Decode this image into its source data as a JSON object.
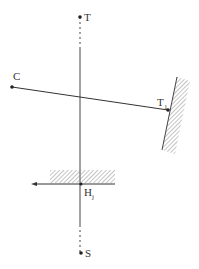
{
  "diagram": {
    "points": {
      "T": {
        "label": "T",
        "x": 80,
        "y": 17
      },
      "C": {
        "label": "C",
        "x": 12,
        "y": 87
      },
      "T1": {
        "label": "T",
        "subscript": "1",
        "x": 168,
        "y": 110
      },
      "Hj": {
        "label": "H",
        "subscript": "j",
        "x": 81,
        "y": 184
      },
      "S": {
        "label": "S",
        "x": 81,
        "y": 253
      }
    },
    "colors": {
      "line": "#333333",
      "hatch": "#888888"
    }
  }
}
